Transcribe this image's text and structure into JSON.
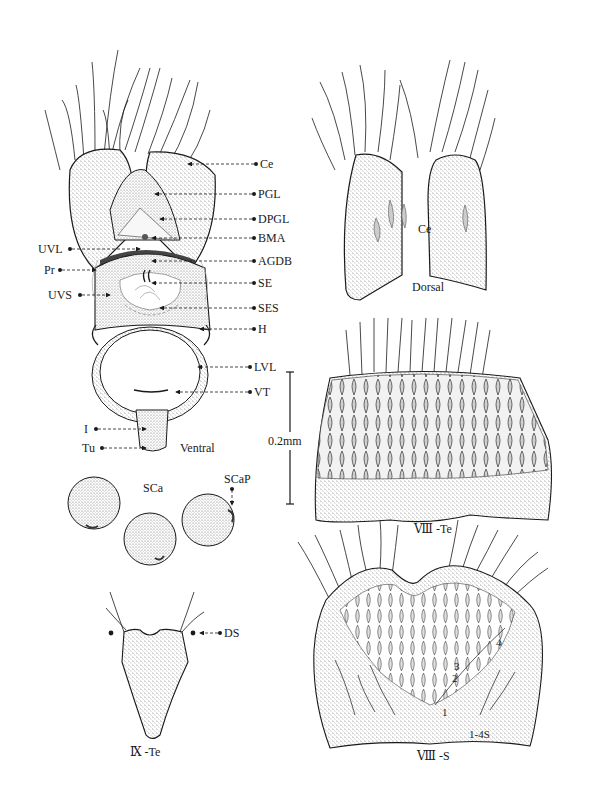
{
  "figure": {
    "type": "morphological illustration",
    "background": "#ffffff",
    "ink": "#1a1a1a"
  },
  "panels": {
    "ventral": {
      "view_label": "Ventral",
      "callouts": [
        {
          "id": "Ce",
          "label": "Ce",
          "side": "right"
        },
        {
          "id": "PGL",
          "label": "PGL",
          "side": "right"
        },
        {
          "id": "DPGL",
          "label": "DPGL",
          "side": "right"
        },
        {
          "id": "BMA",
          "label": "BMA",
          "side": "right"
        },
        {
          "id": "UVL",
          "label": "UVL",
          "side": "left"
        },
        {
          "id": "AGDB",
          "label": "AGDB",
          "side": "right"
        },
        {
          "id": "Pr",
          "label": "Pr",
          "side": "left"
        },
        {
          "id": "SE",
          "label": "SE",
          "side": "right"
        },
        {
          "id": "UVS",
          "label": "UVS",
          "side": "left"
        },
        {
          "id": "SES",
          "label": "SES",
          "side": "right"
        },
        {
          "id": "H",
          "label": "H",
          "side": "right"
        },
        {
          "id": "LVL",
          "label": "LVL",
          "side": "right"
        },
        {
          "id": "VT",
          "label": "VT",
          "side": "right"
        },
        {
          "id": "I",
          "label": "I",
          "side": "left"
        },
        {
          "id": "Tu",
          "label": "Tu",
          "side": "left"
        }
      ]
    },
    "dorsal_cerci": {
      "view_label": "Dorsal",
      "part_label": "Ce"
    },
    "scale_bar": {
      "label": "0.2mm"
    },
    "tergite_8": {
      "label": "Ⅷ -Te"
    },
    "spermathecae": {
      "label": "SCa",
      "callout": "SCaP"
    },
    "tergite_9": {
      "label": "Ⅸ -Te",
      "callout": "DS"
    },
    "sternite_8": {
      "label": "Ⅷ -S",
      "seta_label": "1-4S",
      "seta_numbers": [
        "1",
        "2",
        "3",
        "4"
      ]
    }
  }
}
